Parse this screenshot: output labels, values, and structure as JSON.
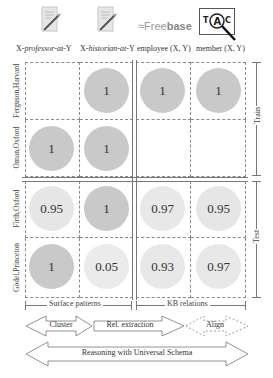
{
  "columns": [
    {
      "label_prefix": "X-",
      "label_italic": "professor-at",
      "label_suffix": "-Y",
      "icon": "document-pen-icon"
    },
    {
      "label_prefix": "X-",
      "label_italic": "historian-at",
      "label_suffix": "-Y",
      "icon": "document-pen-icon"
    },
    {
      "label": "employee (X, Y)",
      "icon": "freebase-logo",
      "logo_text_light": "Free",
      "logo_text_bold": "base"
    },
    {
      "label": "member (X, Y)",
      "icon": "tac-magnifier-icon",
      "icon_letters": [
        "T",
        "A",
        "C"
      ]
    }
  ],
  "rows": [
    {
      "label": "Ferguson,Harvard",
      "values": [
        "",
        "1",
        "1",
        "1"
      ]
    },
    {
      "label": "Oman,Oxford",
      "values": [
        "1",
        "1",
        "",
        ""
      ]
    },
    {
      "label": "Firth,Oxford",
      "values": [
        "0.95",
        "1",
        "0.97",
        "0.95"
      ]
    },
    {
      "label": "Gödel,Princeton",
      "values": [
        "1",
        "0.05",
        "0.93",
        "0.97"
      ]
    }
  ],
  "side_groups": {
    "train": "Train",
    "test": "Test"
  },
  "bottom_groups": {
    "surface": "Surface patterns",
    "kb": "KB relations"
  },
  "arrows": {
    "cluster": "Cluster",
    "rel_extraction": "Rel. extraction",
    "align": "Align",
    "universal": "Reasoning with Universal Schema"
  },
  "colors": {
    "circle_dark": "#c9c9c9",
    "circle_light": "#e6e6e6",
    "grid_dash": "#8a8a8a",
    "line": "#777777"
  }
}
